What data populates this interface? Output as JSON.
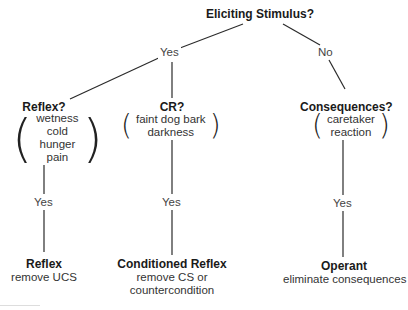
{
  "root": {
    "label": "Eliciting Stimulus?"
  },
  "edges": {
    "root_yes": "Yes",
    "root_no": "No",
    "reflex_yes": "Yes",
    "cr_yes": "Yes",
    "cons_yes": "Yes"
  },
  "decisions": {
    "reflex": {
      "label": "Reflex?",
      "items": [
        "wetness",
        "cold",
        "hunger",
        "pain"
      ]
    },
    "cr": {
      "label": "CR?",
      "items": [
        "faint dog bark",
        "darkness"
      ]
    },
    "consequences": {
      "label": "Consequences?",
      "items": [
        "caretaker",
        "reaction"
      ]
    }
  },
  "outcomes": {
    "reflex": {
      "label": "Reflex",
      "lines": [
        "remove UCS"
      ]
    },
    "conditioned_reflex": {
      "label": "Conditioned Reflex",
      "lines": [
        "remove CS or",
        "countercondition"
      ]
    },
    "operant": {
      "label": "Operant",
      "lines": [
        "eliminate consequences"
      ]
    }
  },
  "colors": {
    "line": "#2a2a2a",
    "text": "#1a1a1a",
    "background": "#ffffff"
  }
}
